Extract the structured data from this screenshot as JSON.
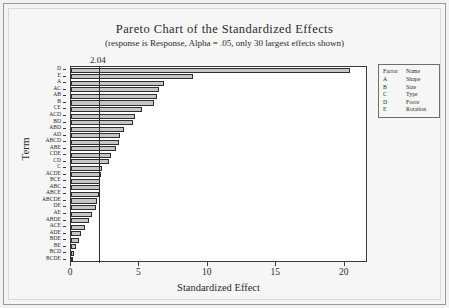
{
  "chart_data": {
    "type": "bar",
    "orientation": "horizontal",
    "title": "Pareto Chart of the Standardized Effects",
    "subtitle": "(response is Response, Alpha = .05, only 30 largest effects shown)",
    "xlabel": "Standardized Effect",
    "ylabel": "Term",
    "xlim": [
      0,
      21.7
    ],
    "xticks": [
      0,
      5,
      10,
      15,
      20
    ],
    "xtick_labels": [
      "0",
      "5",
      "10",
      "15",
      "20"
    ],
    "grid": false,
    "legend_position": "right",
    "reference_line": {
      "value": 2.04,
      "label": "2.04"
    },
    "categories": [
      "D",
      "E",
      "A",
      "AC",
      "AB",
      "B",
      "CE",
      "ACD",
      "BD",
      "ABD",
      "AD",
      "ABCD",
      "ABE",
      "CDE",
      "CD",
      "C",
      "ACDE",
      "BCE",
      "ABC",
      "ABCE",
      "ABCDE",
      "DE",
      "AE",
      "ABDE",
      "ACE",
      "ADE",
      "BDE",
      "BE",
      "BCD",
      "BCDE"
    ],
    "values": [
      20.4,
      8.9,
      6.8,
      6.4,
      6.3,
      6.1,
      5.2,
      4.7,
      4.5,
      3.9,
      3.6,
      3.5,
      3.3,
      2.9,
      2.8,
      2.3,
      2.2,
      2.15,
      2.1,
      2.05,
      1.9,
      1.8,
      1.5,
      1.35,
      1.05,
      0.75,
      0.55,
      0.4,
      0.25,
      0.12
    ],
    "bar_color": "#c6c6c6",
    "bar_edge_color": "#2e2e2e",
    "legend": {
      "headers": [
        "Factor",
        "Name"
      ],
      "rows": [
        [
          "A",
          "Shape"
        ],
        [
          "B",
          "Size"
        ],
        [
          "C",
          "Type"
        ],
        [
          "D",
          "Force"
        ],
        [
          "E",
          "Rotation"
        ]
      ]
    }
  }
}
